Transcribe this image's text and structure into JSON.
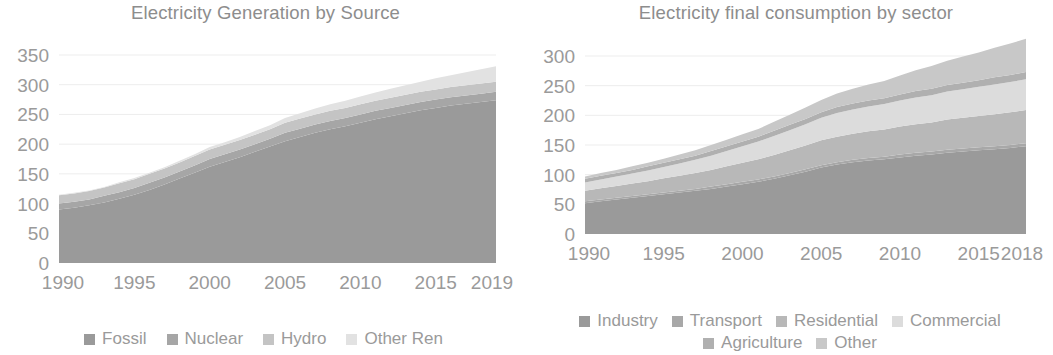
{
  "charts": [
    {
      "id": "electricity-generation",
      "title": "Electricity Generation by Source",
      "y_ticks": [
        "0",
        "50",
        "100",
        "150",
        "200",
        "250",
        "300",
        "350"
      ],
      "x_ticks": [
        "1990",
        "1995",
        "2000",
        "2005",
        "2010",
        "2015",
        "2019"
      ],
      "legend": [
        {
          "label": "Fossil",
          "color": "#9a9a9a"
        },
        {
          "label": "Nuclear",
          "color": "#a6a6a6"
        },
        {
          "label": "Hydro",
          "color": "#c4c4c4"
        },
        {
          "label": "Other Ren",
          "color": "#e2e2e2"
        }
      ]
    },
    {
      "id": "electricity-consumption",
      "title": "Electricity final consumption by sector",
      "y_ticks": [
        "0",
        "50",
        "100",
        "150",
        "200",
        "250",
        "300"
      ],
      "x_ticks": [
        "1990",
        "1995",
        "2000",
        "2005",
        "2010",
        "2015",
        "2018"
      ],
      "legend": [
        {
          "label": "Industry",
          "color": "#9a9a9a"
        },
        {
          "label": "Transport",
          "color": "#a8a8a8"
        },
        {
          "label": "Residential",
          "color": "#b8b8b8"
        },
        {
          "label": "Commercial",
          "color": "#dcdcdc"
        },
        {
          "label": "Agriculture",
          "color": "#b0b0b0"
        },
        {
          "label": "Other",
          "color": "#c8c8c8"
        }
      ]
    }
  ],
  "chart_data": [
    {
      "type": "area",
      "id": "electricity-generation",
      "title": "Electricity Generation by Source",
      "xlabel": "",
      "ylabel": "",
      "stacked": true,
      "grid": true,
      "legend_position": "bottom",
      "xlim": [
        1990,
        2019
      ],
      "ylim": [
        0,
        350
      ],
      "yticks": [
        0,
        50,
        100,
        150,
        200,
        250,
        300,
        350
      ],
      "xticks": [
        1990,
        1995,
        2000,
        2005,
        2010,
        2015,
        2019
      ],
      "x": [
        1990,
        1991,
        1992,
        1993,
        1994,
        1995,
        1996,
        1997,
        1998,
        1999,
        2000,
        2001,
        2002,
        2003,
        2004,
        2005,
        2006,
        2007,
        2008,
        2009,
        2010,
        2011,
        2012,
        2013,
        2014,
        2015,
        2016,
        2017,
        2018,
        2019
      ],
      "series": [
        {
          "name": "Fossil",
          "color": "#9a9a9a",
          "values": [
            90,
            93,
            97,
            102,
            108,
            115,
            123,
            132,
            142,
            152,
            162,
            170,
            178,
            187,
            196,
            205,
            212,
            219,
            225,
            230,
            236,
            242,
            247,
            252,
            257,
            261,
            265,
            268,
            271,
            274
          ]
        },
        {
          "name": "Nuclear",
          "color": "#a6a6a6",
          "values": [
            10,
            10,
            10,
            11,
            11,
            11,
            12,
            12,
            12,
            12,
            13,
            13,
            13,
            13,
            13,
            14,
            14,
            14,
            14,
            14,
            14,
            14,
            14,
            14,
            14,
            14,
            14,
            14,
            14,
            14
          ]
        },
        {
          "name": "Hydro",
          "color": "#c4c4c4",
          "values": [
            14,
            14,
            14,
            14,
            15,
            15,
            15,
            15,
            15,
            16,
            16,
            16,
            16,
            16,
            16,
            17,
            17,
            17,
            17,
            17,
            17,
            17,
            17,
            17,
            17,
            17,
            17,
            17,
            17,
            17
          ]
        },
        {
          "name": "Other Ren",
          "color": "#e2e2e2",
          "values": [
            1,
            1,
            1,
            1,
            2,
            2,
            2,
            2,
            3,
            3,
            4,
            4,
            5,
            6,
            7,
            8,
            9,
            10,
            11,
            12,
            13,
            14,
            15,
            16,
            17,
            19,
            20,
            22,
            24,
            26
          ]
        }
      ]
    },
    {
      "type": "area",
      "id": "electricity-consumption",
      "title": "Electricity final consumption by sector",
      "xlabel": "",
      "ylabel": "",
      "stacked": true,
      "grid": true,
      "legend_position": "bottom",
      "xlim": [
        1990,
        2018
      ],
      "ylim": [
        0,
        300
      ],
      "yticks": [
        0,
        50,
        100,
        150,
        200,
        250,
        300
      ],
      "xticks": [
        1990,
        1995,
        2000,
        2005,
        2010,
        2015,
        2018
      ],
      "x": [
        1990,
        1991,
        1992,
        1993,
        1994,
        1995,
        1996,
        1997,
        1998,
        1999,
        2000,
        2001,
        2002,
        2003,
        2004,
        2005,
        2006,
        2007,
        2008,
        2009,
        2010,
        2011,
        2012,
        2013,
        2014,
        2015,
        2016,
        2017,
        2018
      ],
      "series": [
        {
          "name": "Industry",
          "color": "#9a9a9a",
          "values": [
            52,
            55,
            58,
            61,
            64,
            67,
            70,
            73,
            76,
            80,
            84,
            88,
            93,
            99,
            105,
            112,
            117,
            121,
            124,
            126,
            129,
            132,
            134,
            137,
            139,
            141,
            143,
            145,
            148
          ]
        },
        {
          "name": "Transport",
          "color": "#a8a8a8",
          "values": [
            3,
            3,
            3,
            3,
            3,
            3,
            3,
            3,
            4,
            4,
            4,
            4,
            4,
            4,
            4,
            4,
            4,
            4,
            4,
            4,
            5,
            5,
            5,
            5,
            5,
            5,
            5,
            5,
            5
          ]
        },
        {
          "name": "Residential",
          "color": "#b8b8b8",
          "values": [
            18,
            19,
            20,
            21,
            22,
            24,
            25,
            27,
            28,
            30,
            32,
            34,
            36,
            38,
            40,
            42,
            43,
            44,
            45,
            46,
            47,
            48,
            49,
            51,
            52,
            53,
            54,
            55,
            56
          ]
        },
        {
          "name": "Commercial",
          "color": "#dcdcdc",
          "values": [
            14,
            15,
            16,
            17,
            18,
            19,
            21,
            22,
            24,
            26,
            28,
            30,
            32,
            34,
            36,
            38,
            40,
            41,
            42,
            43,
            44,
            45,
            46,
            47,
            48,
            49,
            50,
            51,
            52
          ]
        },
        {
          "name": "Agriculture",
          "color": "#b0b0b0",
          "values": [
            6,
            6,
            6,
            6,
            7,
            7,
            7,
            7,
            8,
            8,
            8,
            8,
            9,
            9,
            9,
            9,
            10,
            10,
            10,
            10,
            10,
            11,
            11,
            11,
            11,
            11,
            12,
            12,
            12
          ]
        },
        {
          "name": "Other",
          "color": "#c8c8c8",
          "values": [
            4,
            5,
            5,
            6,
            6,
            7,
            8,
            9,
            10,
            11,
            12,
            13,
            15,
            17,
            19,
            21,
            23,
            25,
            27,
            29,
            32,
            35,
            38,
            41,
            44,
            47,
            50,
            53,
            56
          ]
        }
      ]
    }
  ]
}
